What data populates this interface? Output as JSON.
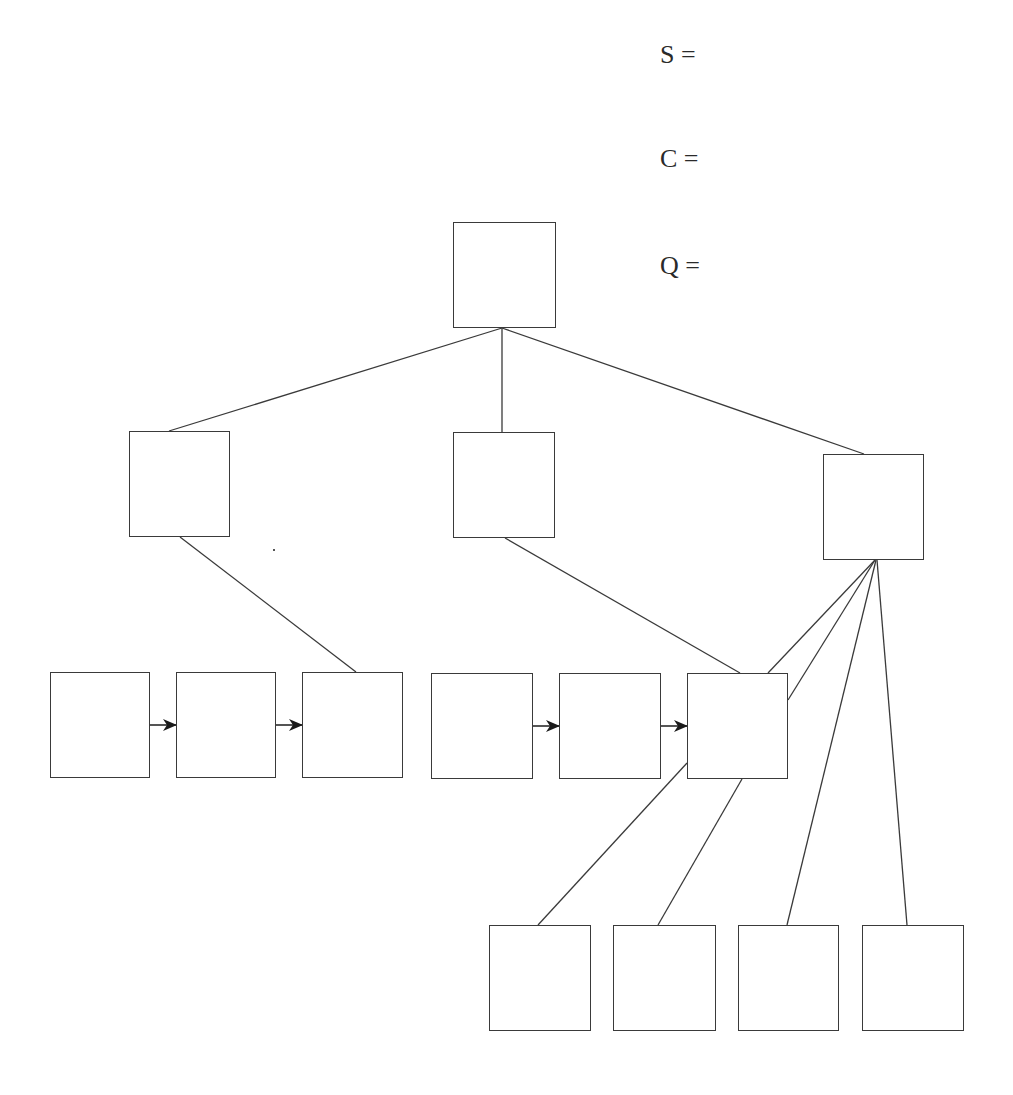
{
  "diagram": {
    "type": "tree-with-linked-lists",
    "stroke_color": "#3a3a3a",
    "labels": [
      {
        "id": "S",
        "text": "S =",
        "x": 660,
        "y": 42
      },
      {
        "id": "C",
        "text": "C =",
        "x": 660,
        "y": 146
      },
      {
        "id": "Q",
        "text": "Q =",
        "x": 660,
        "y": 253
      }
    ],
    "nodes": [
      {
        "id": "root",
        "x": 453,
        "y": 222,
        "w": 103,
        "h": 106,
        "text": ""
      },
      {
        "id": "mid-left",
        "x": 129,
        "y": 431,
        "w": 101,
        "h": 106,
        "text": ""
      },
      {
        "id": "mid-center",
        "x": 453,
        "y": 432,
        "w": 102,
        "h": 106,
        "text": ""
      },
      {
        "id": "mid-right",
        "x": 823,
        "y": 454,
        "w": 101,
        "h": 106,
        "text": ""
      },
      {
        "id": "row1-a",
        "x": 50,
        "y": 672,
        "w": 100,
        "h": 106,
        "text": ""
      },
      {
        "id": "row1-b",
        "x": 176,
        "y": 672,
        "w": 100,
        "h": 106,
        "text": ""
      },
      {
        "id": "row1-c",
        "x": 302,
        "y": 672,
        "w": 101,
        "h": 106,
        "text": ""
      },
      {
        "id": "row2-a",
        "x": 431,
        "y": 673,
        "w": 102,
        "h": 106,
        "text": ""
      },
      {
        "id": "row2-b",
        "x": 559,
        "y": 673,
        "w": 102,
        "h": 106,
        "text": ""
      },
      {
        "id": "row2-c",
        "x": 687,
        "y": 673,
        "w": 101,
        "h": 106,
        "text": ""
      },
      {
        "id": "leaf-1",
        "x": 489,
        "y": 925,
        "w": 102,
        "h": 106,
        "text": ""
      },
      {
        "id": "leaf-2",
        "x": 613,
        "y": 925,
        "w": 103,
        "h": 106,
        "text": ""
      },
      {
        "id": "leaf-3",
        "x": 738,
        "y": 925,
        "w": 101,
        "h": 106,
        "text": ""
      },
      {
        "id": "leaf-4",
        "x": 862,
        "y": 925,
        "w": 102,
        "h": 106,
        "text": ""
      }
    ],
    "edges": [
      {
        "from": "root",
        "to": "mid-left",
        "x1": 502,
        "y1": 328,
        "x2": 169,
        "y2": 431
      },
      {
        "from": "root",
        "to": "mid-center",
        "x1": 502,
        "y1": 328,
        "x2": 502,
        "y2": 432
      },
      {
        "from": "root",
        "to": "mid-right",
        "x1": 502,
        "y1": 328,
        "x2": 864,
        "y2": 454
      },
      {
        "from": "mid-left",
        "to": "row1-c",
        "x1": 180,
        "y1": 537,
        "x2": 356,
        "y2": 672
      },
      {
        "from": "mid-center",
        "to": "row2-c",
        "x1": 505,
        "y1": 538,
        "x2": 740,
        "y2": 673
      },
      {
        "from": "mid-right",
        "to": "row2-c-top",
        "x1": 875,
        "y1": 560,
        "x2": 768,
        "y2": 673
      },
      {
        "from": "mid-right",
        "to": "row2-c-right",
        "x1": 875,
        "y1": 560,
        "x2": 788,
        "y2": 700
      },
      {
        "from": "mid-right",
        "to": "leaf-3",
        "x1": 876,
        "y1": 560,
        "x2": 787,
        "y2": 925
      },
      {
        "from": "mid-right",
        "to": "leaf-4",
        "x1": 877,
        "y1": 560,
        "x2": 907,
        "y2": 925
      },
      {
        "from": "row2-c",
        "to": "leaf-1",
        "x1": 687,
        "y1": 763,
        "x2": 538,
        "y2": 925
      },
      {
        "from": "row2-c",
        "to": "leaf-2",
        "x1": 742,
        "y1": 779,
        "x2": 658,
        "y2": 925
      }
    ],
    "arrows": [
      {
        "from": "row1-a",
        "to": "row1-b",
        "x1": 150,
        "y1": 725,
        "x2": 176,
        "y2": 725
      },
      {
        "from": "row1-b",
        "to": "row1-c",
        "x1": 276,
        "y1": 725,
        "x2": 302,
        "y2": 725
      },
      {
        "from": "row2-a",
        "to": "row2-b",
        "x1": 533,
        "y1": 726,
        "x2": 559,
        "y2": 726
      },
      {
        "from": "row2-b",
        "to": "row2-c",
        "x1": 661,
        "y1": 726,
        "x2": 687,
        "y2": 726
      }
    ],
    "artifacts": [
      {
        "x": 273,
        "y": 549
      }
    ]
  }
}
